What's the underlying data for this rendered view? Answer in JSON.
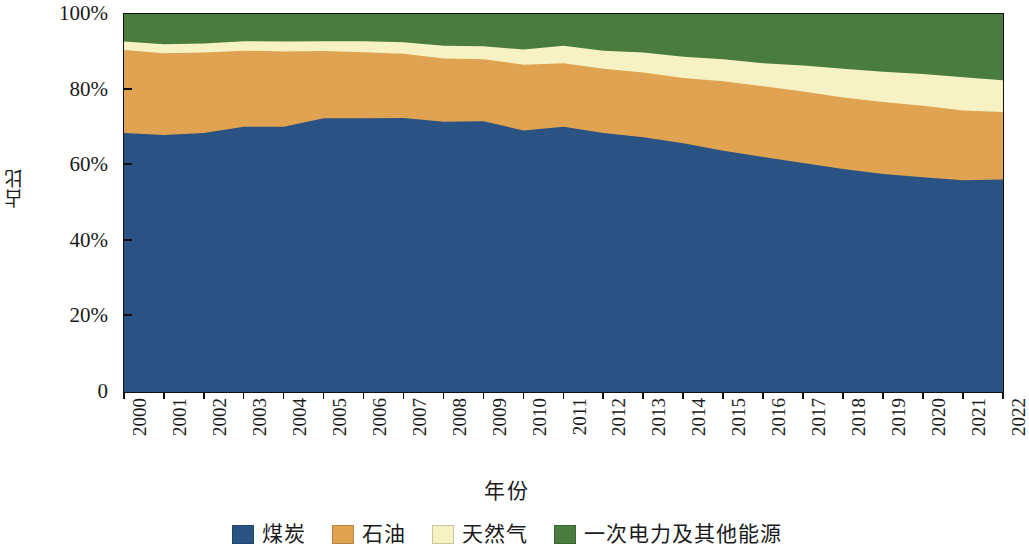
{
  "chart_data": {
    "type": "area",
    "title": "",
    "subtitle": "",
    "xlabel": "年份",
    "ylabel": "占比",
    "stacked": true,
    "normalized": true,
    "grid": false,
    "legend_position": "bottom",
    "ylim": [
      0,
      100
    ],
    "ytick_labels": [
      "100%",
      "80%",
      "60%",
      "40%",
      "20%",
      "0"
    ],
    "ytick_values": [
      100,
      80,
      60,
      40,
      20,
      0
    ],
    "x": [
      2000,
      2001,
      2002,
      2003,
      2004,
      2005,
      2006,
      2007,
      2008,
      2009,
      2010,
      2011,
      2012,
      2013,
      2014,
      2015,
      2016,
      2017,
      2018,
      2019,
      2020,
      2021,
      2022
    ],
    "categories": [
      "2000",
      "2001",
      "2002",
      "2003",
      "2004",
      "2005",
      "2006",
      "2007",
      "2008",
      "2009",
      "2010",
      "2011",
      "2012",
      "2013",
      "2014",
      "2015",
      "2016",
      "2017",
      "2018",
      "2019",
      "2020",
      "2021",
      "2022"
    ],
    "series": [
      {
        "name": "煤炭",
        "color": "#2a5383",
        "values": [
          68.5,
          68.0,
          68.5,
          70.2,
          70.2,
          72.4,
          72.4,
          72.5,
          71.5,
          71.6,
          69.2,
          70.2,
          68.5,
          67.4,
          65.8,
          63.8,
          62.2,
          60.6,
          59.0,
          57.7,
          56.8,
          56.0,
          56.2
        ]
      },
      {
        "name": "石油",
        "color": "#e0a352",
        "values": [
          22.0,
          21.6,
          21.3,
          20.1,
          19.9,
          17.8,
          17.5,
          17.0,
          16.7,
          16.4,
          17.4,
          16.8,
          17.0,
          17.1,
          17.3,
          18.4,
          18.7,
          18.9,
          18.9,
          19.0,
          18.9,
          18.5,
          17.9
        ]
      },
      {
        "name": "天然气",
        "color": "#f6f2c4",
        "values": [
          2.2,
          2.4,
          2.4,
          2.5,
          2.6,
          2.6,
          2.9,
          3.0,
          3.4,
          3.5,
          4.0,
          4.6,
          4.8,
          5.3,
          5.6,
          5.8,
          6.1,
          6.9,
          7.6,
          8.0,
          8.4,
          8.8,
          8.4
        ]
      },
      {
        "name": "一次电力及其他能源",
        "color": "#4a7c3f",
        "values": [
          7.3,
          8.0,
          7.8,
          7.2,
          7.3,
          7.2,
          7.2,
          7.5,
          8.4,
          8.5,
          9.4,
          8.4,
          9.7,
          10.2,
          11.3,
          12.0,
          13.0,
          13.6,
          14.5,
          15.3,
          15.9,
          16.7,
          17.5
        ]
      }
    ],
    "boundaries_note": "cumulative tops: coal, coal+oil, coal+oil+gas, 100"
  },
  "legend": {
    "items": [
      {
        "label": "煤炭",
        "color": "#2a5383"
      },
      {
        "label": "石油",
        "color": "#e0a352"
      },
      {
        "label": "天然气",
        "color": "#f6f2c4"
      },
      {
        "label": "一次电力及其他能源",
        "color": "#4a7c3f"
      }
    ]
  },
  "axes": {
    "y_title": "占比",
    "x_title": "年份"
  }
}
